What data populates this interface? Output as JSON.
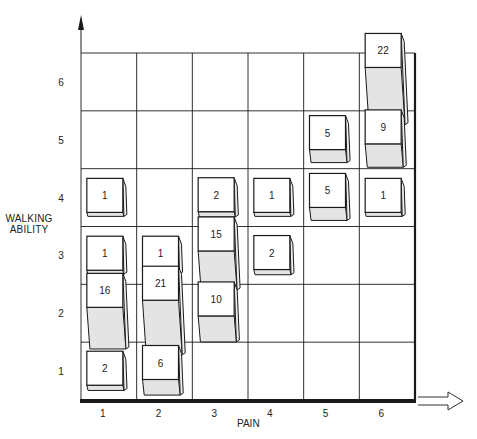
{
  "chart_data": {
    "type": "3d-bubble-grid",
    "title": "",
    "xlabel": "PAIN",
    "ylabel": "WALKING ABILITY",
    "x_ticks": [
      "1",
      "2",
      "3",
      "4",
      "5",
      "6"
    ],
    "y_ticks": [
      "1",
      "2",
      "3",
      "4",
      "5",
      "6"
    ],
    "xlim": [
      1,
      6
    ],
    "ylim": [
      1,
      6
    ],
    "grid": true,
    "legend": "none",
    "points": [
      {
        "pain": 1,
        "walking": 4,
        "count": 1
      },
      {
        "pain": 1,
        "walking": 3,
        "count": 1
      },
      {
        "pain": 1,
        "walking": 2,
        "count": 16
      },
      {
        "pain": 1,
        "walking": 1,
        "count": 2
      },
      {
        "pain": 2,
        "walking": 3,
        "count": 1
      },
      {
        "pain": 2,
        "walking": 2,
        "count": 21
      },
      {
        "pain": 2,
        "walking": 1,
        "count": 6
      },
      {
        "pain": 3,
        "walking": 4,
        "count": 2
      },
      {
        "pain": 3,
        "walking": 3,
        "count": 15
      },
      {
        "pain": 3,
        "walking": 2,
        "count": 10
      },
      {
        "pain": 4,
        "walking": 4,
        "count": 1
      },
      {
        "pain": 4,
        "walking": 3,
        "count": 2
      },
      {
        "pain": 5,
        "walking": 5,
        "count": 5
      },
      {
        "pain": 5,
        "walking": 4,
        "count": 5
      },
      {
        "pain": 6,
        "walking": 6,
        "count": 22
      },
      {
        "pain": 6,
        "walking": 5,
        "count": 9
      },
      {
        "pain": 6,
        "walking": 4,
        "count": 1
      }
    ]
  },
  "labels": {
    "xlabel": "PAIN",
    "ylabel_line1": "WALKING",
    "ylabel_line2": "ABILITY"
  },
  "colors": {
    "line": "#1a1a1a",
    "box_face": "#ffffff",
    "box_shade": "#e4e4e4"
  }
}
